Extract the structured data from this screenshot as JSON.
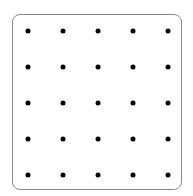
{
  "geoboard": {
    "rows": 5,
    "cols": 5,
    "dot_color": "#000000",
    "border_color": "#8a8a8a",
    "x_positions": [
      28,
      63,
      98,
      133,
      168
    ],
    "y_positions": [
      31,
      67,
      103,
      139,
      175
    ]
  }
}
